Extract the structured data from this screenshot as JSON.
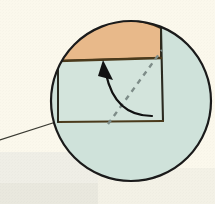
{
  "figure": {
    "title": "Magnified detail callout",
    "description": "Circular magnifier inset showing a fold diagram: a tan region above a horizontal crease, a pale green quadrilateral below it, a dashed diagonal fold line, and a curved arrow indicating the direction of folding.",
    "width": 215,
    "height": 204
  },
  "colors": {
    "page_background": "#fbf8ec",
    "band_lower_left": "#efeee6",
    "band_lower_right": "#f3f1e6",
    "band_bottom": "#e9e8de",
    "circle_fill": "#cfe2da",
    "circle_stroke": "#1a1a1a",
    "tan_region_fill": "#e8b98a",
    "tan_region_stroke": "#3a2a16",
    "quad_fill": "#d3e4dc",
    "quad_stroke": "#2a2a20",
    "crease_line": "#4a3a1c",
    "dashed_fold_line": "#7d8c88",
    "arrow_stroke": "#111111",
    "arrow_head_fill": "#111111",
    "leader_line": "#3a3a32"
  },
  "geometry": {
    "circle": {
      "cx": 131,
      "cy": 101,
      "r": 80
    },
    "tan_region": {
      "label": "tan-flap-region",
      "top_arc_from": [
        58,
        61
      ],
      "top_arc_to": [
        161,
        28
      ],
      "bottom_edge_from": [
        58,
        61
      ],
      "bottom_edge_to": [
        161,
        58
      ]
    },
    "quadrilateral": {
      "label": "green-panel",
      "vertices": [
        [
          58,
          61
        ],
        [
          161,
          58
        ],
        [
          163,
          121
        ],
        [
          58,
          122
        ]
      ]
    },
    "crease_line": {
      "from": [
        58,
        61
      ],
      "to": [
        161,
        58
      ]
    },
    "vertical_edge": {
      "from": [
        161,
        28
      ],
      "to": [
        163,
        121
      ]
    },
    "dashed_fold_line": {
      "from": [
        108,
        124
      ],
      "to": [
        162,
        50
      ],
      "dash": "5 5"
    },
    "curved_arrow": {
      "start": [
        152,
        116
      ],
      "control": [
        118,
        112
      ],
      "end": [
        108,
        72
      ],
      "head_tip": [
        104,
        62
      ],
      "head_size": 13
    },
    "leader_line": {
      "from": [
        0,
        140
      ],
      "to": [
        59,
        121
      ]
    }
  },
  "labels": {
    "magnifier": "magnified-detail-circle",
    "tan_region": "tan-flap-region",
    "green_panel": "green-panel",
    "crease": "crease-line",
    "fold_line": "dashed-fold-line",
    "fold_arrow": "fold-direction-arrow",
    "leader": "callout-leader-line"
  },
  "annotations": {
    "text_items": []
  }
}
